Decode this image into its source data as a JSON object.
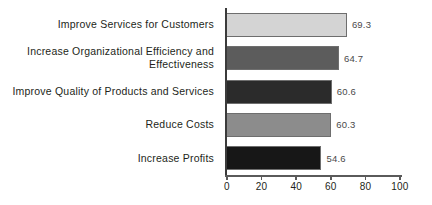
{
  "chart_data": {
    "type": "bar",
    "orientation": "horizontal",
    "title": "",
    "subtitle": "",
    "xlabel": "",
    "ylabel": "",
    "categories": [
      "Improve Services for Customers",
      "Increase Organizational Efficiency and\nEffectiveness",
      "Improve Quality of Products and Services",
      "Reduce Costs",
      "Increase Profits"
    ],
    "values": [
      69.3,
      64.7,
      60.6,
      60.3,
      54.6
    ],
    "value_labels": [
      "69.3",
      "64.7",
      "60.6",
      "60.3",
      "54.6"
    ],
    "bar_colors": [
      "#d4d4d4",
      "#5c5c5c",
      "#2b2b2b",
      "#8c8c8c",
      "#171717"
    ],
    "xlim": [
      0,
      100
    ],
    "xticks": [
      0,
      20,
      40,
      60,
      80,
      100
    ],
    "xtick_labels": [
      "0",
      "20",
      "40",
      "60",
      "80",
      "100"
    ],
    "grid": false,
    "legend": false,
    "legend_position": "none",
    "axis_color": "#5a5a5a",
    "text_color": "#231f20",
    "value_label_color": "#4a4a4a",
    "background": "#ffffff"
  }
}
